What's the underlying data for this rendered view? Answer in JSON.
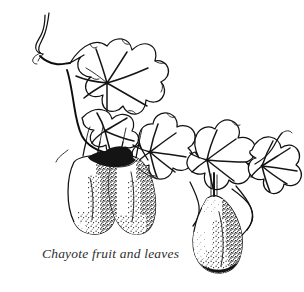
{
  "page": {
    "background_color": "#ffffff",
    "width": 304,
    "height": 292
  },
  "illustration": {
    "title": "Chayote fruit and leaves",
    "subject": "chayote vine",
    "style": "pen-and-ink botanical line drawing",
    "ink_color": "#111111",
    "fill_color": "#ffffff",
    "shadow_color": "#141414",
    "elements": {
      "leaves_count": 5,
      "fruits_count": 3,
      "tendrils_count": 4,
      "leaf_type": "palmate lobed",
      "fruit_shape": "pear-shaped"
    },
    "parts": [
      {
        "name": "tendril-upper-left",
        "label": "curling tendril"
      },
      {
        "name": "leaf-upper-left",
        "label": "upper left palmate leaf"
      },
      {
        "name": "leaf-upper-left-lower",
        "label": "lower lobe leaf"
      },
      {
        "name": "leaf-center",
        "label": "center palmate leaf"
      },
      {
        "name": "leaf-right",
        "label": "right palmate leaf"
      },
      {
        "name": "leaf-far-right",
        "label": "far right palmate leaf"
      },
      {
        "name": "fruit-left",
        "label": "left chayote fruit"
      },
      {
        "name": "fruit-middle",
        "label": "middle chayote fruit"
      },
      {
        "name": "fruit-right",
        "label": "right chayote fruit"
      },
      {
        "name": "main-stem",
        "label": "main vine stem"
      }
    ]
  },
  "caption": {
    "text": "Chayote fruit and leaves",
    "color": "#2e2e2e"
  }
}
